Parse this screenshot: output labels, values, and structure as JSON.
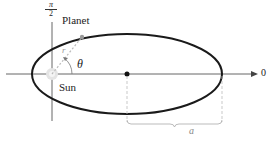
{
  "diagram": {
    "labels": {
      "pi_num": "π",
      "pi_den": "2",
      "planet": "Planet",
      "sun": "Sun",
      "theta": "θ",
      "r": "r",
      "zero": "0",
      "a": "a"
    },
    "colors": {
      "ellipse": "#1a1a1a",
      "axes": "#555555",
      "dashed": "#aaaaaa",
      "planet_dot": "#999999",
      "center_dot": "#111111"
    },
    "geometry": {
      "ellipse": {
        "cx": 127,
        "cy": 74,
        "rx": 95,
        "ry": 40
      },
      "pole": {
        "x": 52,
        "y": 74
      },
      "planet": {
        "x": 82,
        "y": 37
      }
    }
  }
}
